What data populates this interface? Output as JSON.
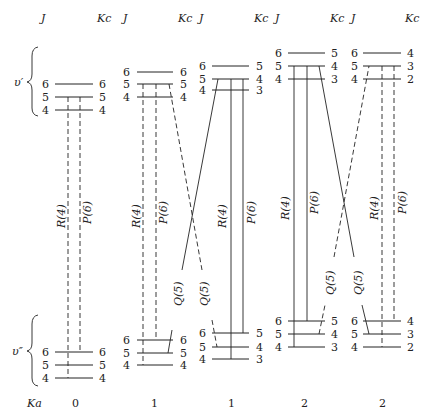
{
  "header": {
    "columns": [
      {
        "j_label": "J",
        "kc_label": "Kc"
      },
      {
        "j_label": "J",
        "kc_label": "Kc"
      },
      {
        "j_label": "J",
        "kc_label": "Kc"
      },
      {
        "j_label": "J",
        "kc_label": "Kc"
      },
      {
        "j_label": "J",
        "kc_label": "Kc"
      }
    ]
  },
  "state_labels": {
    "upper": "υ′",
    "lower": "υ″"
  },
  "footer": {
    "ka_label": "Ka",
    "ka_values": [
      "0",
      "1",
      "1",
      "2",
      "2"
    ]
  },
  "panels": [
    {
      "ka": "0",
      "upper": [
        {
          "j": "6",
          "kc": "6"
        },
        {
          "j": "5",
          "kc": "5"
        },
        {
          "j": "4",
          "kc": "4"
        }
      ],
      "lower": [
        {
          "j": "6",
          "kc": "6"
        },
        {
          "j": "5",
          "kc": "5"
        },
        {
          "j": "4",
          "kc": "4"
        }
      ],
      "transitions": {
        "r": "R(4)",
        "p": "P(6)"
      },
      "line_style": "dashed"
    },
    {
      "ka": "1",
      "upper": [
        {
          "j": "6",
          "kc": "6"
        },
        {
          "j": "5",
          "kc": "5"
        },
        {
          "j": "4",
          "kc": "4"
        }
      ],
      "lower": [
        {
          "j": "6",
          "kc": "6"
        },
        {
          "j": "5",
          "kc": "5"
        },
        {
          "j": "4",
          "kc": "4"
        }
      ],
      "transitions": {
        "r": "R(4)",
        "p": "P(6)",
        "q1": "Q(5)",
        "q2": "Q(5)"
      },
      "line_style": "dashed"
    },
    {
      "ka": "1",
      "upper": [
        {
          "j": "6",
          "kc": "5"
        },
        {
          "j": "5",
          "kc": "4"
        },
        {
          "j": "4",
          "kc": "3"
        }
      ],
      "lower": [
        {
          "j": "6",
          "kc": "5"
        },
        {
          "j": "5",
          "kc": "4"
        },
        {
          "j": "4",
          "kc": "3"
        }
      ],
      "transitions": {
        "r": "R(4)",
        "p": "P(6)"
      },
      "line_style": "solid"
    },
    {
      "ka": "2",
      "upper": [
        {
          "j": "6",
          "kc": "5"
        },
        {
          "j": "5",
          "kc": "4"
        },
        {
          "j": "4",
          "kc": "3"
        }
      ],
      "lower": [
        {
          "j": "6",
          "kc": "5"
        },
        {
          "j": "5",
          "kc": "4"
        },
        {
          "j": "4",
          "kc": "3"
        }
      ],
      "transitions": {
        "r": "R(4)",
        "p": "P(6)",
        "q1": "Q(5)",
        "q2": "Q(5)"
      },
      "line_style": "solid"
    },
    {
      "ka": "2",
      "upper": [
        {
          "j": "6",
          "kc": "4"
        },
        {
          "j": "5",
          "kc": "3"
        },
        {
          "j": "4",
          "kc": "2"
        }
      ],
      "lower": [
        {
          "j": "6",
          "kc": "4"
        },
        {
          "j": "5",
          "kc": "3"
        },
        {
          "j": "4",
          "kc": "2"
        }
      ],
      "transitions": {
        "r": "R(4)",
        "p": "P(6)"
      },
      "line_style": "dashed"
    }
  ]
}
